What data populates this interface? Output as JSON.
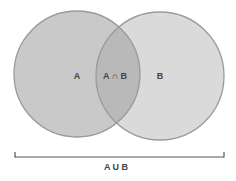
{
  "diagram": {
    "type": "venn",
    "sets": [
      {
        "id": "A",
        "label": "A",
        "fill": "#c9c9c9"
      },
      {
        "id": "B",
        "label": "B",
        "fill": "#dadada"
      }
    ],
    "intersection_label": "A ∩ B",
    "intersection_fill": "#b9b9b9",
    "union_label": "A U B",
    "stroke_color": "#9a9a9a",
    "bracket_color": "#555555"
  }
}
